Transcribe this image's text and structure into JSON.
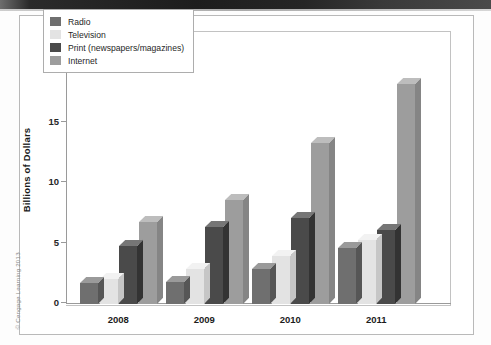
{
  "attribution": "© Cengage Learning 2013",
  "chart_data": {
    "type": "bar",
    "title": "",
    "xlabel": "",
    "ylabel": "Billions of Dollars",
    "ylim": [
      0,
      20
    ],
    "yticks": [
      0,
      5,
      10,
      15,
      20
    ],
    "ytick_labels": [
      "0",
      "5",
      "10",
      "15",
      "20"
    ],
    "grid": false,
    "legend_position": "top-left",
    "categories": [
      "2008",
      "2009",
      "2010",
      "2011"
    ],
    "series": [
      {
        "name": "Radio",
        "color": "#6f6f6f",
        "top_color": "#9a9a9a",
        "side_color": "#565656",
        "values": [
          1.7,
          1.8,
          2.9,
          4.6
        ]
      },
      {
        "name": "Television",
        "color": "#e3e3e3",
        "top_color": "#f2f2f2",
        "side_color": "#c6c6c6",
        "values": [
          2.1,
          2.9,
          4.0,
          5.3
        ]
      },
      {
        "name": "Print (newspapers/magazines)",
        "color": "#4a4a4a",
        "top_color": "#767676",
        "side_color": "#333333",
        "values": [
          4.8,
          6.4,
          7.1,
          6.1
        ]
      },
      {
        "name": "Internet",
        "color": "#9d9d9d",
        "top_color": "#bdbdbd",
        "side_color": "#858585",
        "values": [
          6.8,
          8.6,
          13.3,
          18.2
        ]
      }
    ]
  }
}
